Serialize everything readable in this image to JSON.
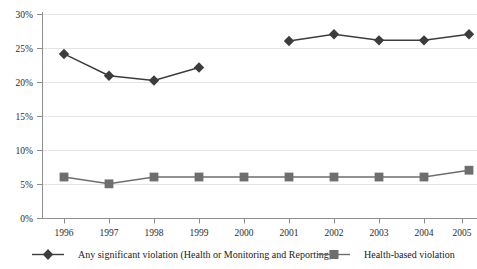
{
  "chart_data": {
    "type": "line",
    "title": "",
    "subtitle": "",
    "xlabel": "",
    "ylabel": "",
    "categories": [
      "1996",
      "1997",
      "1998",
      "1999",
      "2000",
      "2001",
      "2002",
      "2003",
      "2004",
      "2005"
    ],
    "x": [
      1996,
      1997,
      1998,
      1999,
      2000,
      2001,
      2002,
      2003,
      2004,
      2005
    ],
    "ylim": [
      0,
      30
    ],
    "yticks": [
      0,
      5,
      10,
      15,
      20,
      25,
      30
    ],
    "ytick_labels": [
      "0%",
      "5%",
      "10%",
      "15%",
      "20%",
      "25%",
      "30%"
    ],
    "grid": "horizontal",
    "legend_position": "bottom",
    "series": [
      {
        "name": "Any significant violation (Health or Monitoring and Reporting)",
        "marker": "diamond",
        "color": "#3c3c3c",
        "values": [
          24.2,
          21.0,
          20.3,
          22.2,
          null,
          26.1,
          27.1,
          26.2,
          26.2,
          27.1
        ]
      },
      {
        "name": "Health-based violation",
        "marker": "square",
        "color": "#6e6e6e",
        "values": [
          6.1,
          5.1,
          6.1,
          6.1,
          6.1,
          6.1,
          6.1,
          6.1,
          6.1,
          7.1
        ]
      }
    ]
  },
  "legend": {
    "items": [
      {
        "label": "Any significant violation (Health or Monitoring and Reporting)",
        "marker": "diamond",
        "color": "#3c3c3c"
      },
      {
        "label": "Health-based violation",
        "marker": "square",
        "color": "#6e6e6e"
      }
    ]
  },
  "axes": {
    "y_tick_labels": [
      "30%",
      "25%",
      "20%",
      "15%",
      "10%",
      "5%",
      "0%"
    ],
    "x_tick_labels": [
      "1996",
      "1997",
      "1998",
      "1999",
      "2000",
      "2001",
      "2002",
      "2003",
      "2004",
      "2005"
    ]
  },
  "colors": {
    "series_dark": "#3c3c3c",
    "series_gray": "#6e6e6e",
    "grid": "#e2e2e2",
    "axis": "#8a8a8a",
    "text": "#1a1a1a"
  }
}
